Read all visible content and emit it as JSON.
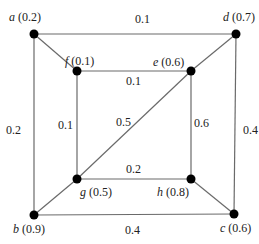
{
  "graph": {
    "nodes": [
      {
        "id": "a",
        "name": "a",
        "value": "(0.2)",
        "x": 34,
        "y": 34,
        "lx": 9,
        "ly": 21
      },
      {
        "id": "d",
        "name": "d",
        "value": "(0.7)",
        "x": 236,
        "y": 34,
        "lx": 223,
        "ly": 21
      },
      {
        "id": "f",
        "name": "f",
        "value": "(0.1)",
        "x": 77,
        "y": 71,
        "lx": 65,
        "ly": 65
      },
      {
        "id": "e",
        "name": "e",
        "value": "(0.6)",
        "x": 191,
        "y": 71,
        "lx": 153,
        "ly": 66
      },
      {
        "id": "g",
        "name": "g",
        "value": "(0.5)",
        "x": 77,
        "y": 179,
        "lx": 80,
        "ly": 196
      },
      {
        "id": "h",
        "name": "h",
        "value": "(0.8)",
        "x": 191,
        "y": 179,
        "lx": 157,
        "ly": 196
      },
      {
        "id": "b",
        "name": "b",
        "value": "(0.9)",
        "x": 34,
        "y": 215,
        "lx": 13,
        "ly": 233
      },
      {
        "id": "c",
        "name": "c",
        "value": "(0.6)",
        "x": 234,
        "y": 214,
        "lx": 220,
        "ly": 232
      }
    ],
    "edges": [
      {
        "from": "a",
        "to": "d",
        "weight": "0.1",
        "lx": 135,
        "ly": 23
      },
      {
        "from": "a",
        "to": "b",
        "weight": "0.2",
        "lx": 6,
        "ly": 134
      },
      {
        "from": "d",
        "to": "c",
        "weight": "0.4",
        "lx": 243,
        "ly": 134
      },
      {
        "from": "b",
        "to": "c",
        "weight": "0.4",
        "lx": 125,
        "ly": 234
      },
      {
        "from": "f",
        "to": "e",
        "weight": "0.1",
        "lx": 126,
        "ly": 85
      },
      {
        "from": "f",
        "to": "g",
        "weight": "0.1",
        "lx": 58,
        "ly": 129
      },
      {
        "from": "e",
        "to": "h",
        "weight": "0.6",
        "lx": 194,
        "ly": 127
      },
      {
        "from": "g",
        "to": "h",
        "weight": "0.2",
        "lx": 126,
        "ly": 173
      },
      {
        "from": "g",
        "to": "e",
        "weight": "0.5",
        "lx": 116,
        "ly": 126
      },
      {
        "from": "a",
        "to": "f",
        "weight": "",
        "lx": 0,
        "ly": 0
      },
      {
        "from": "e",
        "to": "d",
        "weight": "",
        "lx": 0,
        "ly": 0
      },
      {
        "from": "b",
        "to": "g",
        "weight": "",
        "lx": 0,
        "ly": 0
      },
      {
        "from": "h",
        "to": "c",
        "weight": "",
        "lx": 0,
        "ly": 0
      }
    ]
  }
}
